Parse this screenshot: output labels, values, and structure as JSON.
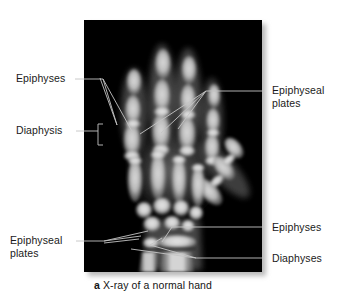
{
  "figure": {
    "caption_letter": "a",
    "caption_text": " X-ray of a normal hand",
    "photo_alt": "xray-of-normal-hand"
  },
  "labels": {
    "left_epiphyses": "Epiphyses",
    "left_diaphysis": "Diaphysis",
    "left_epiphyseal_plates": "Epiphyseal\nplates",
    "right_epiphyseal_plates": "Epiphyseal\nplates",
    "right_epiphyses": "Epiphyses",
    "right_diaphyses": "Diaphyses"
  },
  "colors": {
    "plate_background": "#000000",
    "leader_line": "#c8c8c8",
    "text": "#1a1a1a",
    "page_background": "#ffffff",
    "shadow": "#b9b9b9"
  }
}
